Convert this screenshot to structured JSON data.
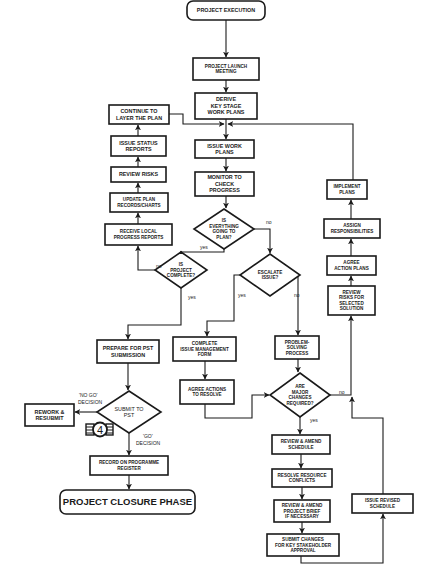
{
  "diagram": {
    "colors": {
      "stroke": "#1a1a1a",
      "fill": "#ffffff",
      "background": "#ffffff"
    },
    "nodes": [
      {
        "id": "project_execution",
        "shape": "terminal",
        "lines": [
          "PROJECT EXECUTION"
        ],
        "x": 187,
        "y": 1,
        "w": 78,
        "h": 19,
        "size": "mid"
      },
      {
        "id": "project_launch",
        "shape": "process",
        "lines": [
          "PROJECT LAUNCH",
          "MEETING"
        ],
        "x": 193,
        "y": 58,
        "w": 66,
        "h": 22,
        "size": "small"
      },
      {
        "id": "derive_plans",
        "shape": "process",
        "lines": [
          "DERIVE",
          "KEY STAGE",
          "WORK PLANS"
        ],
        "x": 195,
        "y": 93,
        "w": 62,
        "h": 26,
        "size": "mid"
      },
      {
        "id": "continue_layer",
        "shape": "process",
        "lines": [
          "CONTINUE TO",
          "LAYER THE PLAN"
        ],
        "x": 109,
        "y": 105,
        "w": 60,
        "h": 19,
        "size": "mid"
      },
      {
        "id": "issue_status",
        "shape": "process",
        "lines": [
          "ISSUE STATUS",
          "REPORTS"
        ],
        "x": 111,
        "y": 136,
        "w": 55,
        "h": 20,
        "size": "mid"
      },
      {
        "id": "review_risks",
        "shape": "process",
        "lines": [
          "REVIEW RISKS"
        ],
        "x": 111,
        "y": 167,
        "w": 55,
        "h": 15,
        "size": "mid"
      },
      {
        "id": "update_plan",
        "shape": "process",
        "lines": [
          "UPDATE PLAN",
          "RECORDS/CHARTS"
        ],
        "x": 110,
        "y": 193,
        "w": 58,
        "h": 19,
        "size": "small"
      },
      {
        "id": "receive_local",
        "shape": "process",
        "lines": [
          "RECEIVE LOCAL",
          "PROGRESS REPORTS"
        ],
        "x": 105,
        "y": 224,
        "w": 67,
        "h": 21,
        "size": "small"
      },
      {
        "id": "issue_work_plans",
        "shape": "process",
        "lines": [
          "ISSUE WORK",
          "PLANS"
        ],
        "x": 195,
        "y": 140,
        "w": 59,
        "h": 18,
        "size": "mid"
      },
      {
        "id": "monitor_progress",
        "shape": "process",
        "lines": [
          "MONITOR TO",
          "CHECK",
          "PROGRESS"
        ],
        "x": 195,
        "y": 172,
        "w": 59,
        "h": 24,
        "size": "mid"
      },
      {
        "id": "everything_plan",
        "shape": "decision",
        "lines": [
          "IS",
          "EVERYTHING",
          "GOING TO",
          "PLAN?"
        ],
        "cx": 224,
        "cy": 229,
        "rw": 30,
        "rh": 20,
        "size": "small"
      },
      {
        "id": "project_complete",
        "shape": "decision",
        "lines": [
          "IS",
          "PROJECT",
          "COMPLETE?"
        ],
        "cx": 181,
        "cy": 270,
        "rw": 26,
        "rh": 18,
        "size": "small"
      },
      {
        "id": "escalate_issue",
        "shape": "decision",
        "lines": [
          "ESCALATE",
          "ISSUE?"
        ],
        "cx": 270,
        "cy": 275,
        "rw": 30,
        "rh": 21,
        "size": "small"
      },
      {
        "id": "implement_plans",
        "shape": "process",
        "lines": [
          "IMPLEMENT",
          "PLANS"
        ],
        "x": 327,
        "y": 180,
        "w": 40,
        "h": 19,
        "size": "small"
      },
      {
        "id": "assign_resp",
        "shape": "process",
        "lines": [
          "ASSIGN",
          "RESPONSIBILITIES"
        ],
        "x": 324,
        "y": 219,
        "w": 56,
        "h": 19,
        "size": "small"
      },
      {
        "id": "agree_action",
        "shape": "process",
        "lines": [
          "AGREE",
          "ACTION PLANS"
        ],
        "x": 327,
        "y": 256,
        "w": 49,
        "h": 19,
        "size": "small"
      },
      {
        "id": "review_risks_solution",
        "shape": "process",
        "lines": [
          "REVIEW",
          "RISKS FOR",
          "SELECTED",
          "SOLUTION"
        ],
        "x": 328,
        "y": 286,
        "w": 47,
        "h": 29,
        "size": "small"
      },
      {
        "id": "prepare_pst",
        "shape": "process",
        "lines": [
          "PREPARE FOR PST",
          "SUBMISSION"
        ],
        "x": 97,
        "y": 340,
        "w": 62,
        "h": 23,
        "size": "mid"
      },
      {
        "id": "complete_issue_form",
        "shape": "process",
        "lines": [
          "COMPLETE",
          "ISSUE MANAGEMENT",
          "FORM"
        ],
        "x": 173,
        "y": 337,
        "w": 63,
        "h": 24,
        "size": "small"
      },
      {
        "id": "problem_solving",
        "shape": "process",
        "lines": [
          "PROBLEM-",
          "SOLVING",
          "PROCESS"
        ],
        "x": 275,
        "y": 336,
        "w": 44,
        "h": 23,
        "size": "small"
      },
      {
        "id": "agree_actions_resolve",
        "shape": "process",
        "lines": [
          "AGREE ACTIONS",
          "TO RESOLVE"
        ],
        "x": 180,
        "y": 380,
        "w": 54,
        "h": 24,
        "size": "small"
      },
      {
        "id": "major_changes",
        "shape": "decision",
        "lines": [
          "ARE",
          "MAJOR",
          "CHANGES",
          "REQUIRED?"
        ],
        "cx": 300,
        "cy": 395,
        "rw": 30,
        "rh": 22,
        "size": "small"
      },
      {
        "id": "submit_pst",
        "shape": "decision",
        "lines": [
          "SUBMIT TO",
          "PST"
        ],
        "cx": 129,
        "cy": 412,
        "rw": 32,
        "rh": 21,
        "size": "mid",
        "normal": true
      },
      {
        "id": "rework_resubmit",
        "shape": "process",
        "lines": [
          "REWORK &",
          "RESUBMIT"
        ],
        "x": 25,
        "y": 404,
        "w": 49,
        "h": 22,
        "size": "mid"
      },
      {
        "id": "record_register",
        "shape": "process",
        "lines": [
          "RECORD ON PROGRAMME",
          "REGISTER"
        ],
        "x": 90,
        "y": 456,
        "w": 78,
        "h": 19,
        "size": "small"
      },
      {
        "id": "project_closure",
        "shape": "terminal",
        "lines": [
          "PROJECT CLOSURE PHASE"
        ],
        "x": 60,
        "y": 490,
        "w": 135,
        "h": 24,
        "size": "big"
      },
      {
        "id": "review_amend_schedule",
        "shape": "process",
        "lines": [
          "REVIEW & AMEND",
          "SCHEDULE"
        ],
        "x": 272,
        "y": 435,
        "w": 58,
        "h": 19,
        "size": "small"
      },
      {
        "id": "resolve_conflicts",
        "shape": "process",
        "lines": [
          "RESOLVE RESOURCE",
          "CONFLICTS"
        ],
        "x": 272,
        "y": 469,
        "w": 60,
        "h": 18,
        "size": "small"
      },
      {
        "id": "review_brief",
        "shape": "process",
        "lines": [
          "REVIEW & AMEND",
          "PROJECT BRIEF",
          "IF NECESSARY"
        ],
        "x": 274,
        "y": 500,
        "w": 56,
        "h": 22,
        "size": "small"
      },
      {
        "id": "issue_revised_schedule",
        "shape": "process",
        "lines": [
          "ISSUE REVISED",
          "SCHEDULE"
        ],
        "x": 352,
        "y": 494,
        "w": 61,
        "h": 19,
        "size": "small"
      },
      {
        "id": "submit_changes",
        "shape": "process",
        "lines": [
          "SUBMIT CHANGES",
          "FOR KEY STAKEHOLDER",
          "APPROVAL"
        ],
        "x": 267,
        "y": 534,
        "w": 72,
        "h": 22,
        "size": "small"
      }
    ],
    "edge_labels": [
      {
        "text": "no",
        "x": 266,
        "y": 224
      },
      {
        "text": "yes",
        "x": 200,
        "y": 249
      },
      {
        "text": "no",
        "x": 156,
        "y": 268
      },
      {
        "text": "yes",
        "x": 188,
        "y": 299
      },
      {
        "text": "yes",
        "x": 238,
        "y": 297
      },
      {
        "text": "no",
        "x": 294,
        "y": 297
      },
      {
        "text": "no",
        "x": 339,
        "y": 394
      },
      {
        "text": "yes",
        "x": 310,
        "y": 422
      },
      {
        "text": "'NO GO'",
        "x": 79,
        "y": 397
      },
      {
        "text": "DECISION",
        "x": 78,
        "y": 404
      },
      {
        "text": "'GO'",
        "x": 143,
        "y": 438
      },
      {
        "text": "DECISION",
        "x": 136,
        "y": 445
      }
    ],
    "badge": {
      "text": "4",
      "icon": "numbered-badge-4-icon"
    }
  }
}
